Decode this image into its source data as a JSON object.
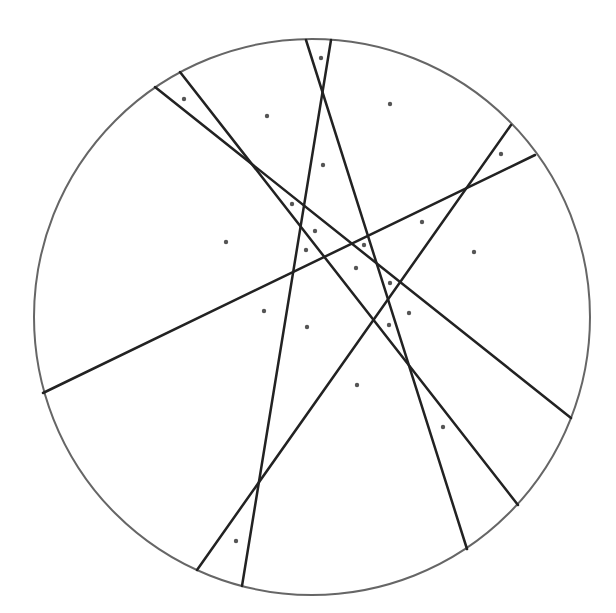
{
  "diagram": {
    "type": "circle-partition-by-chords",
    "width": 616,
    "height": 613,
    "colors": {
      "background": "#ffffff",
      "circle_stroke": "#666666",
      "chord_stroke": "#222222",
      "point_fill": "#555555"
    },
    "circle": {
      "cx": 312,
      "cy": 317,
      "r": 278
    },
    "chords": [
      {
        "x1": 155,
        "y1": 87,
        "x2": 571,
        "y2": 418
      },
      {
        "x1": 180,
        "y1": 72,
        "x2": 518,
        "y2": 505
      },
      {
        "x1": 306,
        "y1": 40,
        "x2": 467,
        "y2": 549
      },
      {
        "x1": 331,
        "y1": 40,
        "x2": 242,
        "y2": 586
      },
      {
        "x1": 511,
        "y1": 125,
        "x2": 197,
        "y2": 570
      },
      {
        "x1": 535,
        "y1": 155,
        "x2": 43,
        "y2": 393
      }
    ],
    "points": [
      {
        "x": 321,
        "y": 58
      },
      {
        "x": 184,
        "y": 99
      },
      {
        "x": 267,
        "y": 116
      },
      {
        "x": 390,
        "y": 104
      },
      {
        "x": 501,
        "y": 154
      },
      {
        "x": 323,
        "y": 165
      },
      {
        "x": 292,
        "y": 204
      },
      {
        "x": 315,
        "y": 231
      },
      {
        "x": 306,
        "y": 250
      },
      {
        "x": 226,
        "y": 242
      },
      {
        "x": 364,
        "y": 245
      },
      {
        "x": 356,
        "y": 268
      },
      {
        "x": 422,
        "y": 222
      },
      {
        "x": 474,
        "y": 252
      },
      {
        "x": 390,
        "y": 283
      },
      {
        "x": 409,
        "y": 313
      },
      {
        "x": 389,
        "y": 325
      },
      {
        "x": 307,
        "y": 327
      },
      {
        "x": 264,
        "y": 311
      },
      {
        "x": 357,
        "y": 385
      },
      {
        "x": 443,
        "y": 427
      },
      {
        "x": 236,
        "y": 541
      }
    ]
  }
}
